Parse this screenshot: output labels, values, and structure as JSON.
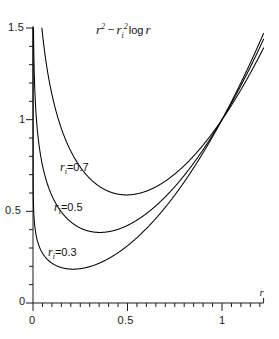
{
  "chart_data": {
    "type": "line",
    "title_parts": {
      "r": "r",
      "sup2a": "2",
      "minus": "−",
      "ri": "r",
      "isub": "i",
      "sup2b": "2",
      "log": "log",
      "r2": "r"
    },
    "xlabel": "r",
    "ylabel": "",
    "xlim": [
      0,
      1.22
    ],
    "ylim": [
      0,
      1.5
    ],
    "grid": false,
    "legend": "inline-curve-labels",
    "xticks_major": [
      0,
      0.5,
      1
    ],
    "xtick_labels": [
      "0",
      "0.5",
      "1"
    ],
    "xticks_minor_step": 0.05,
    "yticks_major": [
      0,
      0.5,
      1,
      1.5
    ],
    "ytick_labels": [
      "0",
      "0.5",
      "1",
      "1.5"
    ],
    "yticks_minor_step": 0.1,
    "formula": "f(r) = r^2 - ri^2 * ln(r)",
    "series": [
      {
        "name": "ri = 0.7",
        "ri": 0.7,
        "label": "=0.7",
        "label_symbol": "r",
        "label_sub": "i",
        "minimum_r": 0.495,
        "minimum_value": 0.5905,
        "value_at_1": 1.0,
        "x": [
          0.012,
          0.02,
          0.03,
          0.05,
          0.08,
          0.12,
          0.18,
          0.25,
          0.33,
          0.41,
          0.495,
          0.58,
          0.66,
          0.75,
          0.85,
          0.95,
          1.0,
          1.08,
          1.16,
          1.21
        ],
        "y": [
          2.165,
          1.918,
          1.719,
          1.471,
          1.244,
          1.053,
          0.873,
          0.742,
          0.649,
          0.604,
          0.5905,
          0.6036,
          0.6394,
          0.7045,
          0.7985,
          0.9274,
          1.0,
          1.1296,
          1.2709,
          1.3576
        ]
      },
      {
        "name": "ri = 0.5",
        "ri": 0.5,
        "label": "=0.5",
        "label_symbol": "r",
        "label_sub": "i",
        "minimum_r": 0.354,
        "minimum_value": 0.3848,
        "value_at_1": 1.0,
        "x": [
          0.006,
          0.01,
          0.02,
          0.035,
          0.06,
          0.1,
          0.15,
          0.22,
          0.28,
          0.354,
          0.43,
          0.52,
          0.62,
          0.72,
          0.82,
          0.92,
          1.0,
          1.08,
          1.16,
          1.21
        ],
        "y": [
          1.276,
          1.151,
          0.978,
          0.839,
          0.706,
          0.586,
          0.497,
          0.427,
          0.397,
          0.3848,
          0.3956,
          0.4338,
          0.5037,
          0.5999,
          0.722,
          0.8671,
          1.0,
          1.1482,
          1.3049,
          1.3992
        ]
      },
      {
        "name": "ri = 0.3",
        "ri": 0.3,
        "label": "=0.3",
        "label_symbol": "r",
        "label_sub": "i",
        "minimum_r": 0.212,
        "minimum_value": 0.1846,
        "value_at_1": 1.0,
        "x": [
          0.0022,
          0.005,
          0.01,
          0.02,
          0.04,
          0.07,
          0.11,
          0.16,
          0.212,
          0.27,
          0.34,
          0.42,
          0.52,
          0.63,
          0.74,
          0.86,
          1.0,
          1.08,
          1.16,
          1.21
        ],
        "y": [
          0.552,
          0.477,
          0.414,
          0.352,
          0.291,
          0.241,
          0.211,
          0.194,
          0.1846,
          0.19,
          0.2127,
          0.2544,
          0.3292,
          0.4383,
          0.575,
          0.7537,
          1.0,
          1.1596,
          1.3302,
          1.4332
        ]
      }
    ],
    "curve_crossing": {
      "r": 1.0,
      "value": 1.0,
      "note": "all curves meet at r=1 since log 1 = 0"
    }
  },
  "axes": {
    "x_axis_name": "r",
    "y_axis_name": "",
    "origin_x_label": "0",
    "origin_y_label": "0"
  },
  "colors": {
    "curve": "#000000",
    "axis": "#1a1a1a",
    "background": "#ffffff",
    "text": "#111111"
  }
}
